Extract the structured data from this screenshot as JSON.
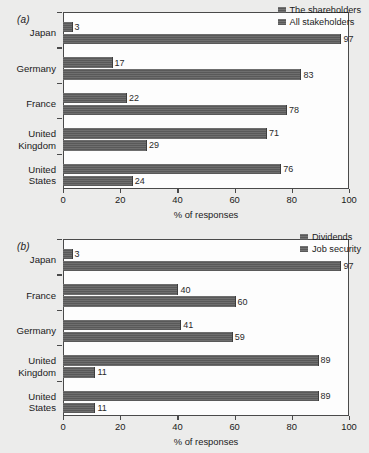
{
  "figure": {
    "background_color": "#ececeb",
    "bar_color": "#595959",
    "axis_color": "#4a4a4a"
  },
  "panels": [
    {
      "label": "(a)",
      "name": "panel-a",
      "legend": [
        {
          "label": "The shareholders",
          "color": "#595959"
        },
        {
          "label": "All stakeholders",
          "color": "#595959"
        }
      ],
      "xlabel": "% of responses",
      "xticks": [
        "0",
        "20",
        "40",
        "60",
        "80",
        "100"
      ],
      "categories": [
        "Japan",
        "Germany",
        "France",
        "United\nKingdom",
        "United\nStates"
      ],
      "rows": [
        {
          "category": "Japan",
          "top": "The shareholders",
          "top_value": 3,
          "bottom": "All stakeholders",
          "bottom_value": 97
        },
        {
          "category": "Germany",
          "top": "The shareholders",
          "top_value": 17,
          "bottom": "All stakeholders",
          "bottom_value": 83
        },
        {
          "category": "France",
          "top": "The shareholders",
          "top_value": 22,
          "bottom": "All stakeholders",
          "bottom_value": 78
        },
        {
          "category": "United Kingdom",
          "top": "The shareholders",
          "top_value": 71,
          "bottom": "All stakeholders",
          "bottom_value": 29
        },
        {
          "category": "United States",
          "top": "The shareholders",
          "top_value": 76,
          "bottom": "All stakeholders",
          "bottom_value": 24
        }
      ]
    },
    {
      "label": "(b)",
      "name": "panel-b",
      "legend": [
        {
          "label": "Dividends",
          "color": "#595959"
        },
        {
          "label": "Job security",
          "color": "#595959"
        }
      ],
      "xlabel": "% of responses",
      "xticks": [
        "0",
        "20",
        "40",
        "60",
        "80",
        "100"
      ],
      "categories": [
        "Japan",
        "France",
        "Germany",
        "United\nKingdom",
        "United\nStates"
      ],
      "rows": [
        {
          "category": "Japan",
          "top": "Dividends",
          "top_value": 3,
          "bottom": "Job security",
          "bottom_value": 97
        },
        {
          "category": "France",
          "top": "Dividends",
          "top_value": 40,
          "bottom": "Job security",
          "bottom_value": 60
        },
        {
          "category": "Germany",
          "top": "Dividends",
          "top_value": 41,
          "bottom": "Job security",
          "bottom_value": 59
        },
        {
          "category": "United Kingdom",
          "top": "Dividends",
          "top_value": 89,
          "bottom": "Job security",
          "bottom_value": 11
        },
        {
          "category": "United States",
          "top": "Dividends",
          "top_value": 89,
          "bottom": "Job security",
          "bottom_value": 11
        }
      ]
    }
  ],
  "chart_data": [
    {
      "type": "bar",
      "orientation": "horizontal",
      "title": "(a)",
      "xlabel": "% of responses",
      "ylabel": "",
      "xlim": [
        0,
        100
      ],
      "xticks": [
        0,
        20,
        40,
        60,
        80,
        100
      ],
      "grid": false,
      "legend_position": "top-right",
      "categories": [
        "Japan",
        "Germany",
        "France",
        "United Kingdom",
        "United States"
      ],
      "series": [
        {
          "name": "The shareholders",
          "values": [
            3,
            17,
            22,
            71,
            76
          ]
        },
        {
          "name": "All stakeholders",
          "values": [
            97,
            83,
            78,
            29,
            24
          ]
        }
      ]
    },
    {
      "type": "bar",
      "orientation": "horizontal",
      "title": "(b)",
      "xlabel": "% of responses",
      "ylabel": "",
      "xlim": [
        0,
        100
      ],
      "xticks": [
        0,
        20,
        40,
        60,
        80,
        100
      ],
      "grid": false,
      "legend_position": "top-right",
      "categories": [
        "Japan",
        "France",
        "Germany",
        "United Kingdom",
        "United States"
      ],
      "series": [
        {
          "name": "Dividends",
          "values": [
            3,
            40,
            41,
            89,
            89
          ]
        },
        {
          "name": "Job security",
          "values": [
            97,
            60,
            59,
            11,
            11
          ]
        }
      ]
    }
  ]
}
